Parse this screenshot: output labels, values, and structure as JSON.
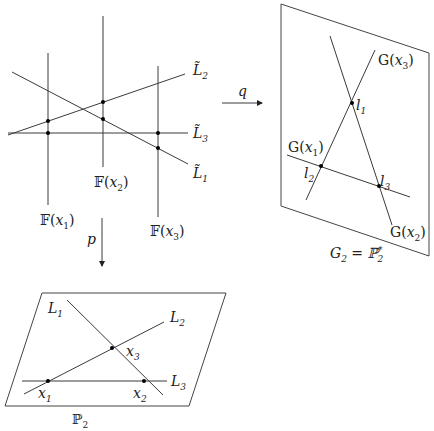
{
  "top_left": {
    "name": "incidence variety F",
    "fibers": [
      {
        "label": "𝔽(",
        "var": "x",
        "sub": "1",
        "close": ")"
      },
      {
        "label": "𝔽(",
        "var": "x",
        "sub": "2",
        "close": ")"
      },
      {
        "label": "𝔽(",
        "var": "x",
        "sub": "3",
        "close": ")"
      }
    ],
    "lines": [
      {
        "label": "L̃",
        "sub": "1"
      },
      {
        "label": "L̃",
        "sub": "2"
      },
      {
        "label": "L̃",
        "sub": "3"
      }
    ]
  },
  "arrows": {
    "q": {
      "label": "q"
    },
    "p": {
      "label": "p"
    }
  },
  "top_right": {
    "caption_lhs": "G",
    "caption_lhs_sub": "2",
    "caption_eq": " = ℙ",
    "caption_rhs_sub": "2",
    "caption_rhs_sup": "*",
    "lines": [
      {
        "label": "G(",
        "var": "x",
        "sub": "1",
        "close": ")"
      },
      {
        "label": "G(",
        "var": "x",
        "sub": "2",
        "close": ")"
      },
      {
        "label": "G(",
        "var": "x",
        "sub": "3",
        "close": ")"
      }
    ],
    "points": [
      {
        "label": "l",
        "sub": "1"
      },
      {
        "label": "l",
        "sub": "2"
      },
      {
        "label": "l",
        "sub": "3"
      }
    ]
  },
  "bottom": {
    "caption": "ℙ",
    "caption_sub": "2",
    "lines": [
      {
        "label": "L",
        "sub": "1"
      },
      {
        "label": "L",
        "sub": "2"
      },
      {
        "label": "L",
        "sub": "3"
      }
    ],
    "points": [
      {
        "label": "x",
        "sub": "1"
      },
      {
        "label": "x",
        "sub": "2"
      },
      {
        "label": "x",
        "sub": "3"
      }
    ]
  }
}
